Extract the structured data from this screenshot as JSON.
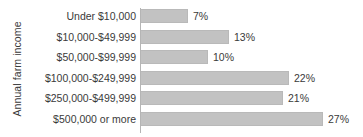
{
  "chart_data": {
    "type": "bar",
    "orientation": "horizontal",
    "title": "",
    "xlabel": "",
    "ylabel": "Annual farm income",
    "categories": [
      "Under $10,000",
      "$10,000-$49,999",
      "$50,000-$99,999",
      "$100,000-$249,999",
      "$250,000-$499,999",
      "$500,000 or more"
    ],
    "values": [
      7,
      13,
      10,
      22,
      21,
      27
    ],
    "value_labels": [
      "7%",
      "13%",
      "10%",
      "22%",
      "21%",
      "27%"
    ],
    "unit": "%",
    "xlim": [
      0,
      27
    ],
    "grid": false,
    "legend": false,
    "bar_color": "#c2c2c2",
    "axis_color": "#b5b5b5",
    "text_color": "#3a3a3a",
    "background": "#ffffff"
  },
  "axis": {
    "y_title": "Annual farm income"
  },
  "rows": [
    {
      "label": "Under $10,000",
      "value": 7,
      "value_label": "7%"
    },
    {
      "label": "$10,000-$49,999",
      "value": 13,
      "value_label": "13%"
    },
    {
      "label": "$50,000-$99,999",
      "value": 10,
      "value_label": "10%"
    },
    {
      "label": "$100,000-$249,999",
      "value": 22,
      "value_label": "22%"
    },
    {
      "label": "$250,000-$499,999",
      "value": 21,
      "value_label": "21%"
    },
    {
      "label": "$500,000 or more",
      "value": 27,
      "value_label": "27%"
    }
  ]
}
